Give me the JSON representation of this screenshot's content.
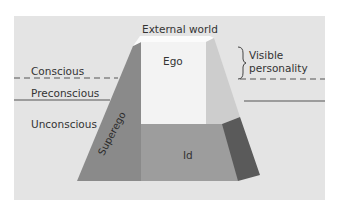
{
  "diagram": {
    "type": "structural model of personality (iceberg/trapezoid)",
    "labels": {
      "external_world": "External world",
      "ego": "Ego",
      "id": "Id",
      "superego": "Superego",
      "visible_personality_line1": "Visible",
      "visible_personality_line2": "personality",
      "conscious": "Conscious",
      "preconscious": "Preconscious",
      "unconscious": "Unconscious"
    },
    "colors": {
      "background_frame": "#e4e4e4",
      "ego_face": "#f4f4f4",
      "top_face": "#fbfbfb",
      "id_face": "#9d9d9d",
      "superego_face": "#8a8a8a",
      "right_face_light": "#cfcfcf",
      "right_face_dark": "#5a5a5a",
      "lines": "#555555"
    },
    "levels": [
      {
        "name": "Conscious",
        "boundary": "dashed"
      },
      {
        "name": "Preconscious",
        "boundary": "solid"
      },
      {
        "name": "Unconscious",
        "boundary": "none"
      }
    ]
  }
}
